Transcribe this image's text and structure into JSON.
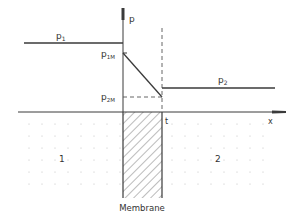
{
  "diagram": {
    "type": "membrane pressure profile",
    "axes": {
      "y_label": "p",
      "x_label": "x",
      "thickness_label": "t"
    },
    "pressure_labels": {
      "p1": {
        "base": "p",
        "sub": "1"
      },
      "p2": {
        "base": "p",
        "sub": "2"
      },
      "p1M": {
        "base": "p",
        "sub": "1M"
      },
      "p2M": {
        "base": "p",
        "sub": "2M"
      }
    },
    "regions": {
      "left": "1",
      "right": "2",
      "membrane": "Membrane"
    },
    "colors": {
      "line": "#3a3a3a",
      "dots": "#bdbdbd",
      "hatch": "#555555",
      "background": "#ffffff"
    }
  }
}
